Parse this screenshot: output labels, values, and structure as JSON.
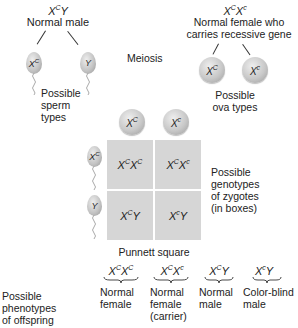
{
  "male": {
    "genotype": {
      "base1": "X",
      "sup1": "C",
      "base2": "Y",
      "sup2": ""
    },
    "label": "Normal male",
    "gametes": [
      {
        "base": "X",
        "sup": "C"
      },
      {
        "base": "Y",
        "sup": ""
      }
    ],
    "gametes_label": [
      "Possible",
      "sperm",
      "types"
    ]
  },
  "female": {
    "genotype": {
      "base1": "X",
      "sup1": "C",
      "base2": "X",
      "sup2": "c"
    },
    "label": [
      "Normal female who",
      "carries recessive gene"
    ],
    "gametes": [
      {
        "base": "X",
        "sup": "C"
      },
      {
        "base": "X",
        "sup": "c"
      }
    ],
    "gametes_label": [
      "Possible",
      "ova types"
    ]
  },
  "meiosis_label": "Meiosis",
  "punnett": {
    "title": "Punnett square",
    "columns": [
      {
        "base": "X",
        "sup": "C"
      },
      {
        "base": "X",
        "sup": "c"
      }
    ],
    "rows": [
      {
        "base": "X",
        "sup": "C"
      },
      {
        "base": "Y",
        "sup": ""
      }
    ],
    "cells": [
      [
        {
          "a": "X",
          "as": "C",
          "b": "X",
          "bs": "C"
        },
        {
          "a": "X",
          "as": "C",
          "b": "X",
          "bs": "c"
        }
      ],
      [
        {
          "a": "X",
          "as": "C",
          "b": "Y",
          "bs": ""
        },
        {
          "a": "X",
          "as": "c",
          "b": "Y",
          "bs": ""
        }
      ]
    ],
    "side_label": [
      "Possible",
      "genotypes",
      "of zygotes",
      "(in boxes)"
    ],
    "cell_color": "#d6d6d6"
  },
  "phenotypes": {
    "label": [
      "Possible",
      "phenotypes",
      "of offspring"
    ],
    "items": [
      {
        "a": "X",
        "as": "C",
        "b": "X",
        "bs": "C",
        "desc": [
          "Normal",
          "female"
        ]
      },
      {
        "a": "X",
        "as": "C",
        "b": "X",
        "bs": "c",
        "desc": [
          "Normal",
          "female",
          "(carrier)"
        ]
      },
      {
        "a": "X",
        "as": "C",
        "b": "Y",
        "bs": "",
        "desc": [
          "Normal",
          "male"
        ]
      },
      {
        "a": "X",
        "as": "c",
        "b": "Y",
        "bs": "",
        "desc": [
          "Color-blind",
          "male"
        ]
      }
    ]
  }
}
